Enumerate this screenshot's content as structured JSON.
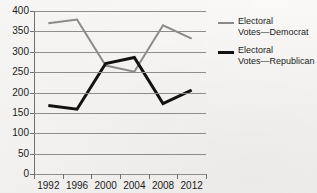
{
  "chart_data": {
    "type": "line",
    "title": "",
    "xlabel": "",
    "ylabel": "",
    "categories": [
      "1992",
      "1996",
      "2000",
      "2004",
      "2008",
      "2012"
    ],
    "series": [
      {
        "name": "Electoral\nVotes—Democrat",
        "color": "#8a8a8a",
        "width": 2,
        "values": [
          370,
          379,
          266,
          251,
          365,
          332
        ]
      },
      {
        "name": "Electoral\nVotes—Republican",
        "color": "#121212",
        "width": 3,
        "values": [
          168,
          159,
          271,
          286,
          173,
          206
        ]
      }
    ],
    "ylim": [
      0,
      400
    ],
    "yticks": [
      0,
      50,
      100,
      150,
      200,
      250,
      300,
      350,
      400
    ],
    "ytick_labels": [
      "0",
      "50",
      "100",
      "150",
      "200",
      "250",
      "300",
      "350",
      "400"
    ],
    "grid": true,
    "legend_position": "right"
  },
  "legend": {
    "items": [
      {
        "label": "Electoral\nVotes—Democrat",
        "swatch": "gray-line-swatch"
      },
      {
        "label": "Electoral\nVotes—Republican",
        "swatch": "black-line-swatch"
      }
    ]
  },
  "title_remnant": ""
}
